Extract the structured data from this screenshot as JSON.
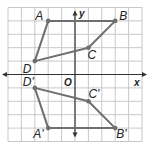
{
  "diagram": {
    "type": "coordinate-plane-reflection",
    "x_axis_label": "x",
    "y_axis_label": "y",
    "origin_label": "O",
    "grid": {
      "x_range": [
        -5,
        5
      ],
      "y_range": [
        -5,
        5
      ],
      "step": 1
    },
    "colors": {
      "grid": "#c8c8c8",
      "axis": "#333333",
      "figure": "#6e6e6e",
      "point": "#6e6e6e"
    },
    "figures": [
      {
        "name": "original",
        "vertices": [
          {
            "label": "A",
            "x": -2,
            "y": 4
          },
          {
            "label": "B",
            "x": 3,
            "y": 4
          },
          {
            "label": "C",
            "x": 1,
            "y": 2
          },
          {
            "label": "D",
            "x": -3,
            "y": 1
          }
        ]
      },
      {
        "name": "image",
        "vertices": [
          {
            "label": "A'",
            "x": -2,
            "y": -4
          },
          {
            "label": "B'",
            "x": 3,
            "y": -4
          },
          {
            "label": "C'",
            "x": 1,
            "y": -2
          },
          {
            "label": "D'",
            "x": -3,
            "y": -1
          }
        ]
      }
    ]
  }
}
